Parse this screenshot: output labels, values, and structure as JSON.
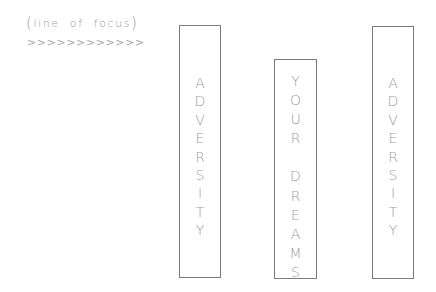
{
  "caption": {
    "open_paren": "(",
    "text": "line of focus",
    "close_paren": ")"
  },
  "arrows": ">>>>>>>>>>>>",
  "boxes": [
    {
      "name": "adversity-left",
      "word": "ADVERSITY",
      "letters": [
        "A",
        "D",
        "V",
        "E",
        "R",
        "S",
        "I",
        "T",
        "Y"
      ]
    },
    {
      "name": "your-dreams",
      "word": "YOUR DREAMS",
      "letters": [
        "Y",
        "O",
        "U",
        "R",
        " ",
        "D",
        "R",
        "E",
        "A",
        "M",
        "S"
      ]
    },
    {
      "name": "adversity-right",
      "word": "ADVERSITY",
      "letters": [
        "A",
        "D",
        "V",
        "E",
        "R",
        "S",
        "I",
        "T",
        "Y"
      ]
    }
  ],
  "colors": {
    "border": "#7a7a7a",
    "text": "#9c9c9c",
    "background": "#ffffff"
  }
}
